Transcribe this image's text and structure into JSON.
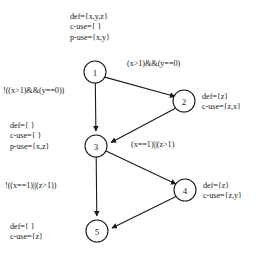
{
  "diagram": {
    "stroke_color": "#1a1a1a",
    "background_color": "#ffffff",
    "nodes": [
      {
        "id": "1",
        "label": "1",
        "cx": 95,
        "cy": 72,
        "r": 11
      },
      {
        "id": "2",
        "label": "2",
        "cx": 184,
        "cy": 101,
        "r": 11
      },
      {
        "id": "3",
        "label": "3",
        "cx": 96,
        "cy": 146,
        "r": 11
      },
      {
        "id": "4",
        "label": "4",
        "cx": 185,
        "cy": 190,
        "r": 11
      },
      {
        "id": "5",
        "label": "5",
        "cx": 97,
        "cy": 231,
        "r": 11
      }
    ],
    "edges": [
      {
        "from": "1",
        "to": "2",
        "label": "(x>1)&&(y==0)"
      },
      {
        "from": "1",
        "to": "3",
        "label": "!((x>1)&&(y==0))"
      },
      {
        "from": "2",
        "to": "3",
        "label": "(x==1)||(z>1)"
      },
      {
        "from": "3",
        "to": "4",
        "label": ""
      },
      {
        "from": "3",
        "to": "5",
        "label": "!((x==1)||(z>1))"
      },
      {
        "from": "4",
        "to": "5",
        "label": ""
      }
    ],
    "annotations": {
      "node1": {
        "def": "def={x,y,z}",
        "c_use": "c-use={ }",
        "p_use": "p-use={x,y}"
      },
      "node2": {
        "def": "def={z}",
        "c_use": "c-use={z,x}"
      },
      "node3": {
        "def": "def={ }",
        "c_use": "c-use={ }",
        "p_use": "p-use={x,z}"
      },
      "node4": {
        "def": "def={z}",
        "c_use": "c-use={z,y}"
      },
      "node5": {
        "def": "def={ }",
        "c_use": "c-use={z}"
      }
    },
    "edge_labels": {
      "e1_2": "(x>1)&&(y==0)",
      "e1_3": "!((x>1)&&(y==0))",
      "e2_3": "(x==1)||(z>1)",
      "e3_5": "!((x==1)||(z>1))"
    }
  }
}
